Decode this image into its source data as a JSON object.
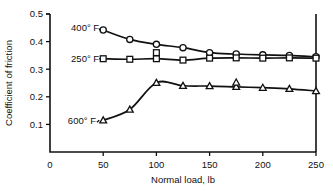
{
  "chart_data": {
    "type": "line",
    "title": "",
    "xlabel": "Normal load, lb",
    "ylabel": "Coefficient of friction",
    "xlim": [
      0,
      250
    ],
    "ylim": [
      0,
      0.5
    ],
    "xticks": [
      0,
      50,
      100,
      150,
      200,
      250
    ],
    "xtick_labels": [
      "0",
      "50",
      "100",
      "150",
      "200",
      "250"
    ],
    "yticks": [
      0.1,
      0.2,
      0.3,
      0.4,
      0.5
    ],
    "ytick_labels": [
      "0.1",
      "0.2",
      "0.3",
      "0.4",
      "0.5"
    ],
    "grid": false,
    "legend_position": "inline-annotations",
    "series": [
      {
        "name": "400° F",
        "marker": "circle",
        "label": "400° F",
        "label_x": 33,
        "label_y": 0.452,
        "leader_to_x": 50,
        "leader_to_y": 0.442,
        "x": [
          50,
          75,
          100,
          125,
          150,
          175,
          200,
          225,
          250
        ],
        "values": [
          0.442,
          0.408,
          0.39,
          0.378,
          0.36,
          0.355,
          0.352,
          0.35,
          0.345
        ]
      },
      {
        "name": "250° F",
        "marker": "square",
        "label": "250° F",
        "label_x": 33,
        "label_y": 0.338,
        "leader_to_x": 50,
        "leader_to_y": 0.338,
        "x": [
          50,
          75,
          100,
          125,
          150,
          175,
          200,
          225,
          250
        ],
        "values": [
          0.338,
          0.336,
          0.338,
          0.333,
          0.34,
          0.341,
          0.34,
          0.341,
          0.34
        ]
      },
      {
        "name": "600° F",
        "marker": "triangle",
        "label": "600° F",
        "label_x": 30,
        "label_y": 0.113,
        "leader_to_x": 50,
        "leader_to_y": 0.115,
        "x": [
          50,
          75,
          100,
          125,
          150,
          175,
          200,
          225,
          250
        ],
        "values": [
          0.115,
          0.154,
          0.251,
          0.24,
          0.239,
          0.236,
          0.233,
          0.229,
          0.221
        ]
      }
    ],
    "outliers": [
      {
        "series": "400° F",
        "marker": "square",
        "x": 100,
        "y": 0.36
      },
      {
        "series": "600° F",
        "marker": "triangle",
        "x": 175,
        "y": 0.252
      }
    ]
  }
}
